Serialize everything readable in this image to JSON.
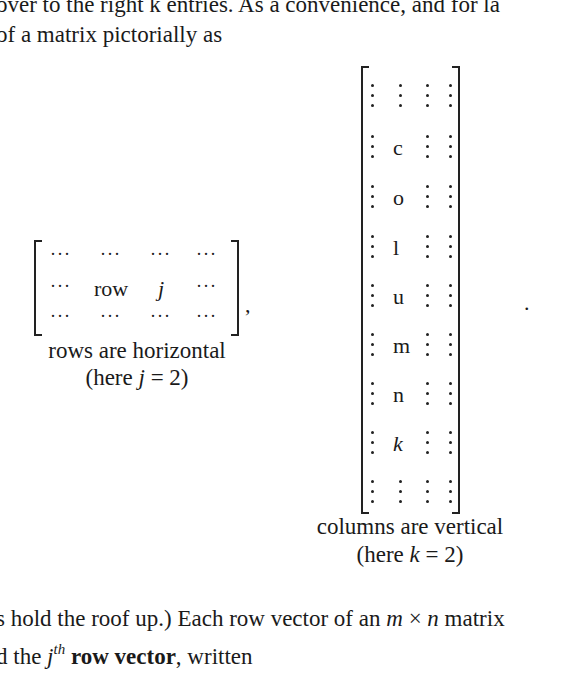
{
  "text": {
    "line1": "over to the right k entries.  As a convenience, and for la",
    "line2": "of a matrix pictorially as",
    "row_matrix": {
      "cells": [
        [
          "···",
          "···",
          "···",
          "···"
        ],
        [
          "···",
          "row",
          "j",
          "···"
        ],
        [
          "···",
          "···",
          "···",
          "···"
        ]
      ],
      "trailing": ",",
      "caption1": "rows are horizontal",
      "caption2": "(here j = 2)"
    },
    "column_matrix": {
      "letters": [
        "c",
        "o",
        "l",
        "u",
        "m",
        "n",
        "k"
      ],
      "trailing": ".",
      "caption1": "columns are vertical",
      "caption2": "(here k = 2)"
    },
    "line3": "s hold the roof up.)  Each row vector of an m × n matrix",
    "line4_pre": "d the ",
    "line4_sup_base": "j",
    "line4_sup": "th",
    "line4_bold": " row vector",
    "line4_post": ", written"
  }
}
